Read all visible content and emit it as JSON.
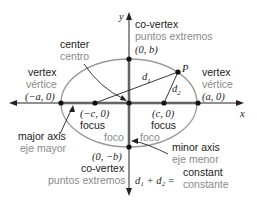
{
  "diagram": {
    "colors": {
      "ellipse": "#9a9a9a",
      "axis_gray": "#a8a8a8",
      "ink": "#222222",
      "spanish": "#8a8a8a"
    },
    "axes": {
      "x_label": "x",
      "y_label": "y"
    },
    "labels": {
      "center": {
        "en": "center",
        "es": "centro"
      },
      "covertex_top": {
        "en": "co-vertex",
        "es": "puntos extremos",
        "coord": "(0, b)"
      },
      "covertex_bottom": {
        "en": "co-vertex",
        "es": "puntos extremos",
        "coord": "(0, −b)"
      },
      "vertex_left": {
        "en": "vertex",
        "es": "vértice",
        "coord": "(−a, 0)"
      },
      "vertex_right": {
        "en": "vertex",
        "es": "vértice",
        "coord": "(a, 0)"
      },
      "focus_left": {
        "en": "focus",
        "es": "foco",
        "coord": "(−c, 0)"
      },
      "focus_right": {
        "en": "focus",
        "es": "foco",
        "coord": "(c, 0)"
      },
      "major_axis": {
        "en": "major axis",
        "es": "eje mayor"
      },
      "minor_axis": {
        "en": "minor axis",
        "es": "eje menor"
      },
      "point": "P",
      "d1": "d",
      "d1_sub": "1",
      "d2": "d",
      "d2_sub": "2",
      "equation": {
        "lhs": "d₁ + d₂ =",
        "en": "constant",
        "es": "constante"
      }
    }
  }
}
